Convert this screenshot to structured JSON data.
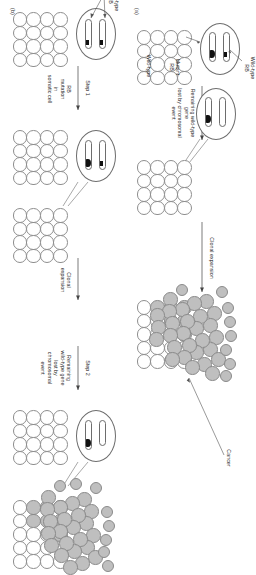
{
  "figure": {
    "title_hidden": "",
    "orientation_degrees": 90,
    "panels": [
      {
        "tag": "(a)",
        "id": "panel-a-hereditary",
        "stage_labels": {
          "start_cell_mutant": "Mutant\nRB",
          "start_cell_wildtype": "Wild-type\nRB",
          "step_name": "Single step",
          "step_detail": "Remaining wild-type gene\nlost by chromosomal event",
          "expansion": "Clonal expansion",
          "outcome": "Cancer",
          "tissue_state": "Wild-type"
        }
      },
      {
        "tag": "(b)",
        "id": "panel-b-sporadic",
        "stage_labels": {
          "start_cell_wildtype": "Wild-type\nRB",
          "step1_name": "Step 1",
          "step1_detail": "RB\nmutation\nin\nsomatic cell",
          "expansion1": "Clonal\nexpansion",
          "step2_name": "Step 2",
          "step2_detail": "Remaining\nwild-type gene\nlost by\nchromosomal\nevent",
          "expansion2": "Clonal\nexpansion",
          "outcome": "Cancer"
        }
      }
    ],
    "colors": {
      "tumor_cell_fill": "#bfbfbf",
      "normal_cell_fill": "#ffffff",
      "outline": "#8e8e8e",
      "locus_marker": "#111111",
      "text": "#2a2a2a"
    },
    "legend_glyphs": {
      "normal_cell": "open-circle",
      "tumor_cell": "gray-filled-circle",
      "wildtype_allele": "black-square-locus",
      "mutant_allele": "black-oval-locus",
      "lost_allele": "empty-locus"
    }
  }
}
